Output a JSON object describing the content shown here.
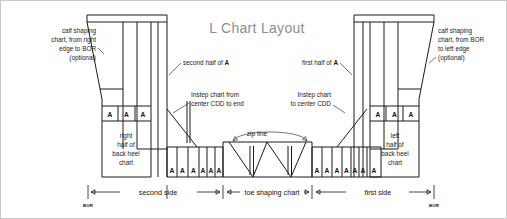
{
  "title": "L Chart Layout",
  "callouts": {
    "left_calf": [
      "calf shaping",
      "chart, from right",
      "edge to BOR",
      "(optional)"
    ],
    "right_calf": [
      "calf shaping",
      "chart, from BOR",
      "to left edge",
      "(optional)"
    ],
    "second_half_a_prefix": "second half of ",
    "second_half_a_bold": "A",
    "first_half_a_prefix": "first half of ",
    "first_half_a_bold": "A",
    "instep_left": [
      "Instep chart from",
      "center CDD to end"
    ],
    "instep_right": [
      "Instep chart",
      "to center CDD"
    ],
    "zip_line": "zip line"
  },
  "blocks": {
    "left_heel": [
      "right",
      "half of",
      "back heel",
      "chart"
    ],
    "right_heel": [
      "left",
      "half of",
      "back heel",
      "chart"
    ]
  },
  "a_label": "A",
  "a_counts": {
    "left_cuff_row": 3,
    "left_lower_row": 6,
    "right_lower_row": 7,
    "right_cuff_row": 3
  },
  "dimensions": [
    {
      "label": "second side"
    },
    {
      "label": "toe shaping chart"
    },
    {
      "label": "first side"
    }
  ],
  "bor_label": "BOR",
  "colors": {
    "line": "#1a1a1a",
    "title": "#8e8e8e",
    "frame": "#c9c9c9",
    "text": "#141414"
  }
}
